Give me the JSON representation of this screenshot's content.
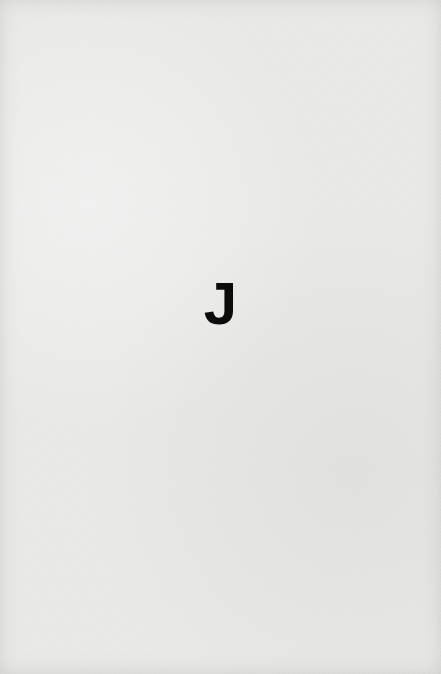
{
  "card": {
    "letter": "J",
    "background_color": "#e9e9e8",
    "text_color": "#0b0b0b"
  }
}
